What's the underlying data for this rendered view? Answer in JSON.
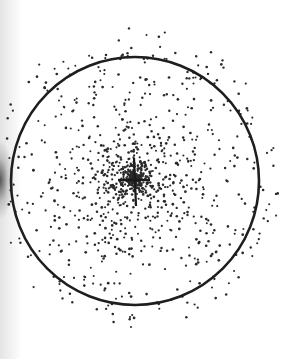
{
  "figure": {
    "title": "Radial dot-density distribution with bounding circle",
    "background": "#ffffff",
    "ink_color": "#2a2a2a",
    "width": 299,
    "height": 359
  },
  "circle": {
    "cx": 135,
    "cy": 181,
    "r": 124,
    "stroke": "#1e1e1e",
    "stroke_width": 2.6
  },
  "center_mark": {
    "shape": "cross",
    "cx": 134,
    "cy": 180,
    "horizontal_half_length": 16,
    "vertical_top": 158,
    "vertical_bottom": 206,
    "color": "#1a1a1a"
  },
  "dots": {
    "count": 1150,
    "center_x": 134,
    "center_y": 178,
    "max_radius": 150,
    "falloff_exponent": 1.7,
    "dot_radius": 1.15,
    "seed": 7
  },
  "left_edge_shadow": {
    "present": true,
    "y_center": 180
  }
}
